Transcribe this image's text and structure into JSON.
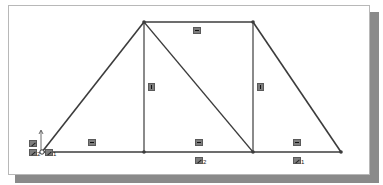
{
  "diagram": {
    "type": "cad-sketch",
    "line_color": "#3c3c3c",
    "relation_icon_color": "#7d7d7d",
    "points": {
      "origin": [
        42,
        152
      ],
      "top_left": [
        144,
        22
      ],
      "top_right": [
        253,
        22
      ],
      "bottom_mid_left": [
        144,
        152
      ],
      "bottom_mid_right": [
        253,
        152
      ],
      "bottom_right": [
        341,
        152
      ]
    },
    "relations": [
      {
        "type": "horizontal",
        "label": "horizontal-relation",
        "pos": [
          196,
          30
        ]
      },
      {
        "type": "vertical",
        "label": "vertical-relation",
        "pos": [
          150,
          84
        ]
      },
      {
        "type": "vertical",
        "label": "vertical-relation",
        "pos": [
          259,
          84
        ]
      },
      {
        "type": "horizontal",
        "label": "horizontal-relation",
        "pos": [
          89,
          140
        ]
      },
      {
        "type": "horizontal",
        "label": "horizontal-relation",
        "pos": [
          196,
          140
        ]
      },
      {
        "type": "horizontal",
        "label": "horizontal-relation",
        "pos": [
          293,
          140
        ]
      }
    ],
    "fix_labels": [
      {
        "text": "",
        "sub": "",
        "pos": [
          29,
          141
        ]
      },
      {
        "text": "",
        "sub": "2",
        "pos": [
          29,
          150
        ]
      },
      {
        "text": "",
        "sub": "1",
        "pos": [
          48,
          150
        ]
      },
      {
        "text": "",
        "sub": "2",
        "pos": [
          196,
          158
        ]
      },
      {
        "text": "",
        "sub": "1",
        "pos": [
          293,
          158
        ]
      }
    ]
  }
}
